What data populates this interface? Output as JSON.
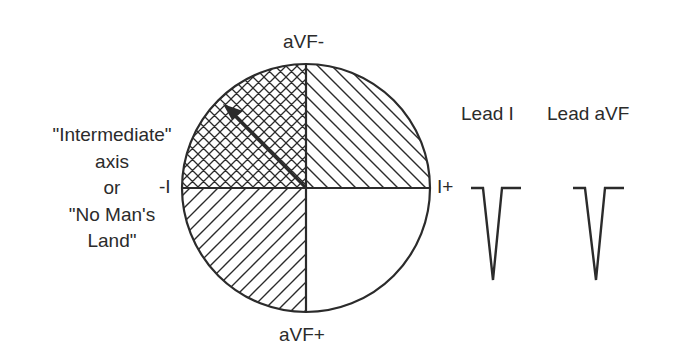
{
  "axes": {
    "top_label": "aVF-",
    "bottom_label": "aVF+",
    "left_label": "-I",
    "right_label": "I+"
  },
  "annotation": {
    "lines": [
      "\"Intermediate\"",
      "axis",
      "or",
      "\"No Man's",
      "Land\""
    ]
  },
  "leads": [
    {
      "label": "Lead I",
      "deflection": "negative"
    },
    {
      "label": "Lead aVF",
      "deflection": "negative"
    }
  ],
  "quadrants": {
    "upper_left": "crosshatch",
    "upper_right": "diagonal-backslash",
    "lower_left": "diagonal-slash",
    "lower_right": "blank"
  },
  "colors": {
    "stroke": "#2b2b2b",
    "background": "#ffffff"
  }
}
